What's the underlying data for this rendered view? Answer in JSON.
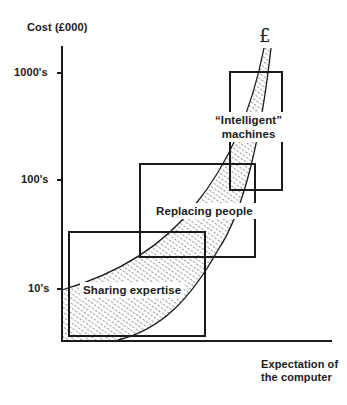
{
  "diagram": {
    "y_axis": {
      "title": "Cost (£000)",
      "ticks": [
        {
          "label": "1000's",
          "y": 73
        },
        {
          "label": "100's",
          "y": 180
        },
        {
          "label": "10's",
          "y": 289
        }
      ]
    },
    "x_axis": {
      "title_line1": "Expectation of",
      "title_line2": "the computer"
    },
    "curve_symbol": "£",
    "regions": [
      {
        "label": "Sharing expertise"
      },
      {
        "label": "Replacing people"
      },
      {
        "label_line1": "“Intelligent”",
        "label_line2": "machines"
      }
    ],
    "colors": {
      "ink": "#1a1a1a",
      "background": "#ffffff"
    }
  }
}
